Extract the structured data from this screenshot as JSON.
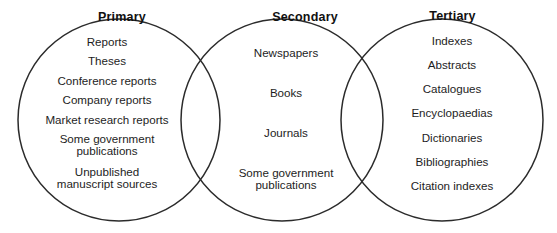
{
  "diagram": {
    "type": "venn-euler",
    "title": "",
    "background_color": "#ffffff",
    "outline_color": "#2b2b2b",
    "text_color": "#1d1d1d",
    "sets": [
      {
        "id": "primary",
        "header": "Primary",
        "items": [
          "Reports",
          "Theses",
          "Conference reports",
          "Company reports",
          "Market research reports",
          "Some government\npublications",
          "Unpublished\nmanuscript sources"
        ]
      },
      {
        "id": "secondary",
        "header": "Secondary",
        "items": [
          "Newspapers",
          "Books",
          "Journals",
          "Some government\npublications"
        ]
      },
      {
        "id": "tertiary",
        "header": "Tertiary",
        "items": [
          "Indexes",
          "Abstracts",
          "Catalogues",
          "Encyclopaedias",
          "Dictionaries",
          "Bibliographies",
          "Citation indexes"
        ]
      }
    ]
  }
}
